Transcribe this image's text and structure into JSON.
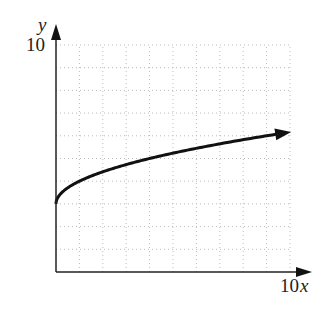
{
  "chart_data": {
    "type": "line",
    "title": "",
    "xlabel": "x",
    "ylabel": "y",
    "xlim": [
      0,
      10
    ],
    "ylim": [
      0,
      10
    ],
    "x_tick_label": "10",
    "y_tick_label": "10",
    "grid": true,
    "grid_step": 1,
    "function": "y = 3 + sqrt(x)",
    "x": [
      0,
      0.25,
      0.5,
      1,
      2,
      3,
      4,
      5,
      6,
      7,
      8,
      9,
      10
    ],
    "series": [
      {
        "name": "curve",
        "values": [
          3,
          3.5,
          3.71,
          4,
          4.41,
          4.73,
          5,
          5.24,
          5.45,
          5.65,
          5.83,
          6,
          6.16
        ]
      }
    ],
    "arrow_end": true
  },
  "labels": {
    "y_axis": "y",
    "y_max": "10",
    "x_axis": "x",
    "x_max": "10"
  }
}
